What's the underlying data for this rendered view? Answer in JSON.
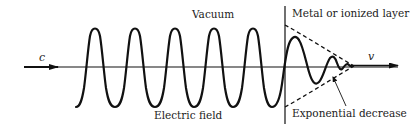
{
  "labels": {
    "vacuum": "Vacuum",
    "metal_layer": "Metal or ionized layer",
    "electric_field": "Electric field",
    "exponential_decrease": "Exponential decrease",
    "incoming_speed": "c",
    "penetrating_speed": "v"
  },
  "colors": {
    "stroke": "#111111",
    "background": "#ffffff"
  }
}
